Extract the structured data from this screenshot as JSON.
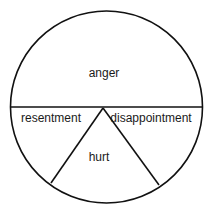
{
  "diagram": {
    "type": "divided-circle",
    "stroke_color": "#111111",
    "background": "#ffffff",
    "regions": [
      {
        "id": "anger",
        "label": "anger"
      },
      {
        "id": "resentment",
        "label": "resentment"
      },
      {
        "id": "hurt",
        "label": "hurt"
      },
      {
        "id": "disappointment",
        "label": "disappointment"
      }
    ]
  }
}
